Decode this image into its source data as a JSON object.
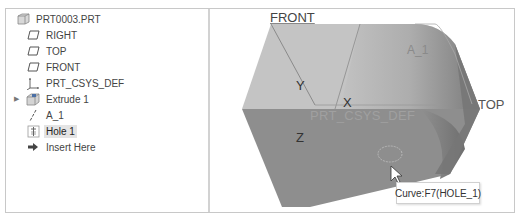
{
  "model_tree": {
    "root": {
      "label": "PRT0003.PRT",
      "icon": "part-icon"
    },
    "items": [
      {
        "label": "RIGHT",
        "icon": "datum-plane-icon"
      },
      {
        "label": "TOP",
        "icon": "datum-plane-icon"
      },
      {
        "label": "FRONT",
        "icon": "datum-plane-icon"
      },
      {
        "label": "PRT_CSYS_DEF",
        "icon": "coordinate-system-icon"
      },
      {
        "label": "Extrude 1",
        "icon": "extrude-icon",
        "expandable": true
      },
      {
        "label": "A_1",
        "icon": "axis-icon"
      },
      {
        "label": "Hole 1",
        "icon": "hole-icon",
        "selected": true
      },
      {
        "label": "Insert Here",
        "icon": "insert-arrow-icon"
      }
    ]
  },
  "viewport": {
    "labels": {
      "front": "FRONT",
      "top": "TOP",
      "axis": "A_1",
      "csys": "PRT_CSYS_DEF",
      "x": "X",
      "y": "Y",
      "z": "Z"
    },
    "tooltip": "Curve:F7(HOLE_1)",
    "colors": {
      "top_face": "#c4c4c4",
      "front_face": "#8e8e8e",
      "side_face": "#7a7a7a",
      "datum_lines": "#9a9a9a"
    }
  }
}
